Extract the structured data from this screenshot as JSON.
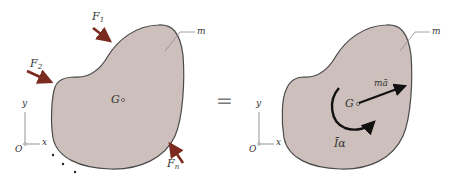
{
  "diagram": {
    "left_panel": {
      "body_label": "m",
      "center_label": "G",
      "forces": [
        {
          "name": "F",
          "sub": "1"
        },
        {
          "name": "F",
          "sub": "2"
        },
        {
          "name": "F",
          "sub": "n"
        }
      ],
      "axes": {
        "origin": "O",
        "x": "x",
        "y": "y"
      }
    },
    "equals": "=",
    "right_panel": {
      "body_label": "m",
      "center_label": "G",
      "linear_inertia_label": "mā",
      "rotational_inertia_label": "Īα",
      "axes": {
        "origin": "O",
        "x": "x",
        "y": "y"
      }
    },
    "colors": {
      "body_fill": "#cdbfbb",
      "body_outline": "#4a4a4a",
      "force_arrow": "#7a2a1e",
      "inertia_arrow": "#111111",
      "leader_line": "#8a8a8a",
      "axis_line": "#888888"
    }
  }
}
